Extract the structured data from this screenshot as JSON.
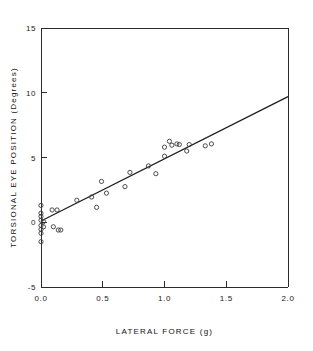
{
  "chart_data": {
    "type": "scatter",
    "title": "",
    "xlabel": "LATERAL FORCE (g)",
    "ylabel": "TORSIONAL EYE POSITION (Degrees)",
    "xlim": [
      0.0,
      2.0
    ],
    "ylim": [
      -5,
      15
    ],
    "xticks": [
      0.0,
      0.5,
      1.0,
      1.5,
      2.0
    ],
    "xtick_labels": [
      "0.0",
      "0.5",
      "1.0",
      "1.5",
      "2.0"
    ],
    "yticks": [
      -5,
      0,
      5,
      10,
      15
    ],
    "ytick_labels": [
      "-5",
      "0",
      "5",
      "10",
      "15"
    ],
    "grid": false,
    "legend": "none",
    "marker": "open-circle",
    "series": [
      {
        "name": "Torsional eye position vs lateral force",
        "points": [
          [
            0.0,
            1.3
          ],
          [
            0.0,
            0.7
          ],
          [
            0.0,
            0.45
          ],
          [
            0.0,
            0.15
          ],
          [
            0.0,
            -0.25
          ],
          [
            0.0,
            -0.55
          ],
          [
            0.0,
            -0.85
          ],
          [
            0.0,
            -1.5
          ],
          [
            0.02,
            0.05
          ],
          [
            0.02,
            -0.35
          ],
          [
            0.09,
            0.95
          ],
          [
            0.1,
            -0.35
          ],
          [
            0.13,
            0.95
          ],
          [
            0.14,
            -0.6
          ],
          [
            0.16,
            -0.6
          ],
          [
            0.29,
            1.7
          ],
          [
            0.41,
            1.95
          ],
          [
            0.45,
            1.15
          ],
          [
            0.49,
            3.15
          ],
          [
            0.53,
            2.25
          ],
          [
            0.68,
            2.75
          ],
          [
            0.72,
            3.85
          ],
          [
            0.87,
            4.35
          ],
          [
            0.93,
            3.75
          ],
          [
            1.0,
            5.1
          ],
          [
            1.0,
            5.8
          ],
          [
            1.04,
            6.25
          ],
          [
            1.06,
            5.95
          ],
          [
            1.1,
            6.05
          ],
          [
            1.12,
            6.0
          ],
          [
            1.18,
            5.5
          ],
          [
            1.2,
            6.0
          ],
          [
            1.33,
            5.9
          ],
          [
            1.38,
            6.05
          ]
        ]
      }
    ],
    "fit_line": {
      "name": "linear regression fit",
      "x0": 0.0,
      "y0": 0.1,
      "x1": 2.0,
      "y1": 9.7
    }
  }
}
